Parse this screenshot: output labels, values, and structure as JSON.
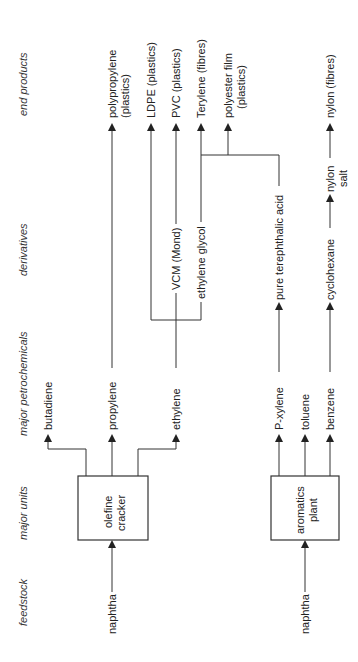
{
  "diagram": {
    "orientation": "rotated 90° counter-clockwise; flow runs bottom to top",
    "stages": [
      {
        "id": "feedstock",
        "label": "feedstock"
      },
      {
        "id": "units",
        "label": "major units"
      },
      {
        "id": "petrochem",
        "label": "major petrochemicals"
      },
      {
        "id": "derivatives",
        "label": "derivatives"
      },
      {
        "id": "end",
        "label": "end products"
      }
    ],
    "feedstock": {
      "naphtha_1": "naphtha",
      "naphtha_2": "naphtha"
    },
    "units": {
      "cracker_line1": "olefine",
      "cracker_line2": "cracker",
      "aromatics_line1": "aromatics",
      "aromatics_line2": "plant"
    },
    "petrochemicals": {
      "butadiene": "butadiene",
      "propylene": "propylene",
      "ethylene": "ethylene",
      "pxylene": "P-xylene",
      "toluene": "toluene",
      "benzene": "benzene"
    },
    "derivatives": {
      "vcm": "VCM (Mond)",
      "glycol": "ethylene glycol",
      "pta": "pure terephthalic acid",
      "cyclohexane": "cyclohexane",
      "nylon_salt_1": "nylon",
      "nylon_salt_2": "salt"
    },
    "end_products": {
      "pp_1": "polypropylene",
      "pp_2": "(plastics)",
      "ldpe": "LDPE (plastics)",
      "pvc": "PVC (plastics)",
      "terylene": "Terylene (fibres)",
      "pfilm_1": "polyester film",
      "pfilm_2": "(plastics)",
      "nylon": "nylon (fibres)"
    },
    "edges": [
      [
        "naphtha",
        "olefine cracker"
      ],
      [
        "naphtha",
        "aromatics plant"
      ],
      [
        "olefine cracker",
        "butadiene"
      ],
      [
        "olefine cracker",
        "propylene"
      ],
      [
        "olefine cracker",
        "ethylene"
      ],
      [
        "propylene",
        "polypropylene (plastics)"
      ],
      [
        "ethylene",
        "LDPE (plastics)"
      ],
      [
        "ethylene",
        "VCM (Mond)"
      ],
      [
        "ethylene",
        "ethylene glycol"
      ],
      [
        "VCM (Mond)",
        "PVC (plastics)"
      ],
      [
        "ethylene glycol",
        "Terylene (fibres)"
      ],
      [
        "ethylene glycol",
        "polyester film (plastics)"
      ],
      [
        "aromatics plant",
        "P-xylene"
      ],
      [
        "aromatics plant",
        "toluene"
      ],
      [
        "aromatics plant",
        "benzene"
      ],
      [
        "P-xylene",
        "pure terephthalic acid"
      ],
      [
        "pure terephthalic acid",
        "Terylene (fibres)"
      ],
      [
        "pure terephthalic acid",
        "polyester film (plastics)"
      ],
      [
        "benzene",
        "cyclohexane"
      ],
      [
        "cyclohexane",
        "nylon salt"
      ],
      [
        "nylon salt",
        "nylon (fibres)"
      ]
    ]
  }
}
